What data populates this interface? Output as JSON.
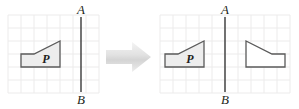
{
  "figure": {
    "type": "geometry-transformation-diagram",
    "width": 299,
    "height": 109,
    "background": "#ffffff"
  },
  "colors": {
    "grid_line": "#ecebeb",
    "grid_line_strong": "#e4e2e2",
    "shape_fill": "#ededed",
    "shape_stroke": "#5a5a5a",
    "mirror_line": "#3a3a3a",
    "label_text": "#231f20",
    "arrow_light": "#f2f2f2",
    "arrow_mid": "#dedede",
    "arrow_dark": "#c9c9c9"
  },
  "panels": [
    {
      "id": "before",
      "name": "left-panel",
      "grid": {
        "x": 8,
        "y": 15,
        "cell": 13,
        "cols": 7,
        "rows": 6
      },
      "mirror_line": {
        "x": 81,
        "y_top": 17,
        "y_bottom": 92,
        "label_top": "A",
        "label_bottom": "B"
      },
      "shapes": [
        {
          "id": "p-original",
          "name": "polygon-p",
          "label": "P",
          "label_x": 46,
          "label_y": 63,
          "points": "21,54 34,54 60,41 60,67 21,67"
        }
      ]
    },
    {
      "id": "after",
      "name": "right-panel",
      "grid": {
        "x": 160,
        "y": 15,
        "cell": 13,
        "cols": 10,
        "rows": 6
      },
      "mirror_line": {
        "x": 225,
        "y_top": 17,
        "y_bottom": 92,
        "label_top": "A",
        "label_bottom": "B"
      },
      "shapes": [
        {
          "id": "p-original-after",
          "name": "polygon-p",
          "label": "P",
          "label_x": 190,
          "label_y": 63,
          "points": "165,54 178,54 204,41 204,67 165,67"
        },
        {
          "id": "p-reflected",
          "name": "polygon-p-reflected",
          "label": "",
          "label_x": 0,
          "label_y": 0,
          "points": "285,54 272,54 246,41 246,67 285,67"
        }
      ]
    }
  ],
  "arrow": {
    "name": "transformation-arrow",
    "direction": "right",
    "x": 106,
    "y": 42,
    "width": 45,
    "height": 30
  },
  "legend": {
    "shape_label": "P",
    "line_label_top": "A",
    "line_label_bottom": "B"
  }
}
